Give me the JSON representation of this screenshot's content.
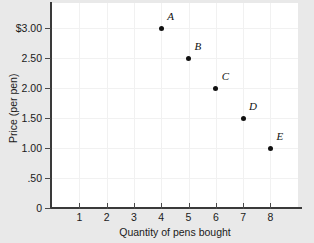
{
  "chart_data": {
    "type": "scatter",
    "title": "",
    "xlabel": "Quantity of pens bought",
    "ylabel": "Price (per pen)",
    "xlim": [
      0,
      9
    ],
    "ylim": [
      0,
      3.5
    ],
    "grid": true,
    "legend": "none",
    "x_ticks": [
      "1",
      "2",
      "3",
      "4",
      "5",
      "6",
      "7",
      "8"
    ],
    "x_tick_values": [
      1,
      2,
      3,
      4,
      5,
      6,
      7,
      8
    ],
    "y_ticks": [
      "$3.00",
      "2.50",
      "2.00",
      "1.50",
      "1.00",
      ".50",
      "0"
    ],
    "y_tick_values": [
      3.0,
      2.5,
      2.0,
      1.5,
      1.0,
      0.5,
      0.0
    ],
    "points": [
      {
        "label": "A",
        "x": 4,
        "y": 3.0
      },
      {
        "label": "B",
        "x": 5,
        "y": 2.5
      },
      {
        "label": "C",
        "x": 6,
        "y": 2.0
      },
      {
        "label": "D",
        "x": 7,
        "y": 1.5
      },
      {
        "label": "E",
        "x": 8,
        "y": 1.0
      }
    ],
    "marker_color": "#111111",
    "background_color": "#e9e9e9",
    "plot_background_color": "#ffffff",
    "axis_color": "#3a3a3a"
  }
}
